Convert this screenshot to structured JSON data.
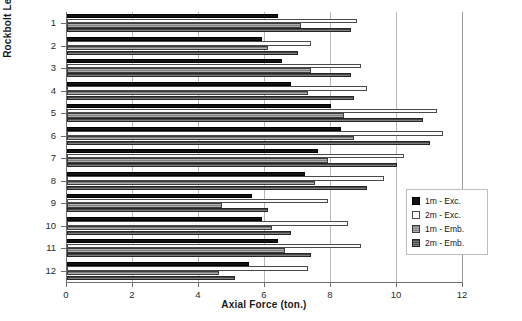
{
  "chart_data": {
    "type": "bar",
    "orientation": "horizontal",
    "title": "",
    "xlabel": "Axial Force (ton.)",
    "ylabel": "Rockbolt Levels",
    "categories": [
      "1",
      "2",
      "3",
      "4",
      "5",
      "6",
      "7",
      "8",
      "9",
      "10",
      "11",
      "12"
    ],
    "xlim": [
      0,
      12
    ],
    "xticks": [
      0,
      2,
      4,
      6,
      8,
      10,
      12
    ],
    "grid": "vertical",
    "legend_position": "right-inside",
    "series": [
      {
        "name": "1m - Exc.",
        "color": "#111111",
        "values": [
          6.4,
          5.9,
          6.5,
          6.8,
          8.0,
          8.3,
          7.6,
          7.2,
          5.6,
          5.9,
          6.4,
          5.5
        ]
      },
      {
        "name": "2m - Exc.",
        "color": "#fbfbfb",
        "values": [
          8.8,
          7.4,
          8.9,
          9.1,
          11.2,
          11.4,
          10.2,
          9.6,
          7.9,
          8.5,
          8.9,
          7.3
        ]
      },
      {
        "name": "1m - Emb.",
        "color": "#8d8d8d",
        "values": [
          7.1,
          6.1,
          7.4,
          7.3,
          8.4,
          8.7,
          7.9,
          7.5,
          4.7,
          6.2,
          6.6,
          4.6
        ]
      },
      {
        "name": "2m - Emb.",
        "color": "#5b5b5b",
        "values": [
          8.6,
          7.0,
          8.6,
          8.7,
          10.8,
          11.0,
          10.0,
          9.1,
          6.1,
          6.8,
          7.4,
          5.1
        ]
      }
    ]
  },
  "legend": {
    "items": [
      {
        "label": "1m - Exc."
      },
      {
        "label": "2m - Exc."
      },
      {
        "label": "1m - Emb."
      },
      {
        "label": "2m - Emb."
      }
    ]
  }
}
